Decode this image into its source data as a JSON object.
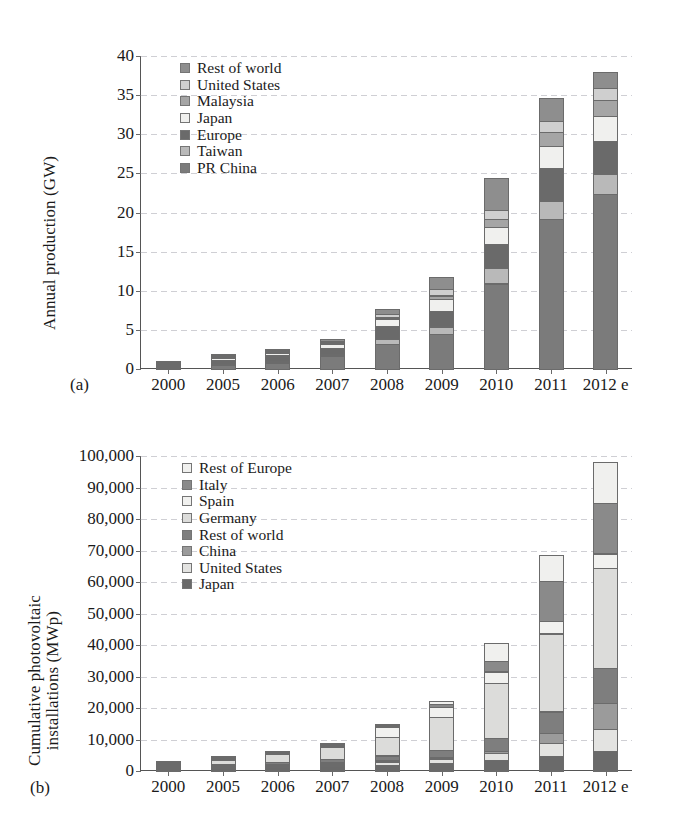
{
  "figure": {
    "panels": [
      {
        "key": "a",
        "label": "(a)",
        "ylabel": "Annual production (GW)"
      },
      {
        "key": "b",
        "label": "(b)",
        "ylabel_line1": "Cumulative photovoltaic",
        "ylabel_line2": "installations (MWp)"
      }
    ]
  },
  "chart_data": [
    {
      "type": "bar",
      "stacked": true,
      "panel": "a",
      "title": "",
      "xlabel": "",
      "ylabel": "Annual production (GW)",
      "ylim": [
        0,
        40
      ],
      "yticks": [
        0,
        5,
        10,
        15,
        20,
        25,
        30,
        35,
        40
      ],
      "ytick_labels": [
        "0",
        "5",
        "10",
        "15",
        "20",
        "25",
        "30",
        "35",
        "40"
      ],
      "grid": true,
      "legend_position": "upper-left-inside",
      "categories": [
        "2000",
        "2005",
        "2006",
        "2007",
        "2008",
        "2009",
        "2010",
        "2011",
        "2012 e"
      ],
      "series": [
        {
          "name": "PR China",
          "color": "#7b7b7b",
          "values": [
            0.05,
            0.55,
            0.9,
            1.7,
            3.3,
            4.5,
            11.0,
            19.2,
            22.4
          ]
        },
        {
          "name": "Taiwan",
          "color": "#b9b9b9",
          "values": [
            0.01,
            0.1,
            0.15,
            0.3,
            0.65,
            1.1,
            2.1,
            2.5,
            2.7
          ]
        },
        {
          "name": "Europe",
          "color": "#6a6a6a",
          "values": [
            0.1,
            0.55,
            0.8,
            0.95,
            1.75,
            2.1,
            3.1,
            4.2,
            4.3
          ]
        },
        {
          "name": "Japan",
          "color": "#f0f0ee",
          "values": [
            0.1,
            0.35,
            0.45,
            0.6,
            1.1,
            1.6,
            2.3,
            2.9,
            3.3
          ]
        },
        {
          "name": "Malaysia",
          "color": "#a5a5a5",
          "values": [
            0.0,
            0.02,
            0.05,
            0.08,
            0.2,
            0.5,
            1.1,
            1.9,
            2.1
          ]
        },
        {
          "name": "United States",
          "color": "#cfcfcf",
          "values": [
            0.04,
            0.15,
            0.2,
            0.3,
            0.5,
            0.9,
            1.2,
            1.5,
            1.6
          ]
        },
        {
          "name": "Rest of world",
          "color": "#8e8e8e",
          "values": [
            0.05,
            0.18,
            0.25,
            0.4,
            0.7,
            1.7,
            4.2,
            3.0,
            2.2
          ]
        }
      ]
    },
    {
      "type": "bar",
      "stacked": true,
      "panel": "b",
      "title": "",
      "xlabel": "",
      "ylabel": "Cumulative photovoltaic installations (MWp)",
      "ylim": [
        0,
        100000
      ],
      "yticks": [
        0,
        10000,
        20000,
        30000,
        40000,
        50000,
        60000,
        70000,
        80000,
        90000,
        100000
      ],
      "ytick_labels": [
        "0",
        "10,000",
        "20,000",
        "30,000",
        "40,000",
        "50,000",
        "60,000",
        "70,000",
        "80,000",
        "90,000",
        "100,000"
      ],
      "grid": true,
      "legend_position": "upper-left-inside",
      "categories": [
        "2000",
        "2005",
        "2006",
        "2007",
        "2008",
        "2009",
        "2010",
        "2011",
        "2012 e"
      ],
      "series": [
        {
          "name": "Japan",
          "color": "#6a6a6a",
          "values": [
            330,
            1420,
            1710,
            1920,
            2150,
            2630,
            3620,
            4910,
            6600
          ]
        },
        {
          "name": "United States",
          "color": "#e3e3e1",
          "values": [
            140,
            480,
            620,
            830,
            1170,
            1620,
            2530,
            4380,
            7200
          ]
        },
        {
          "name": "China",
          "color": "#9b9b9b",
          "values": [
            20,
            70,
            90,
            110,
            150,
            310,
            900,
            3300,
            8300
          ]
        },
        {
          "name": "Rest of world",
          "color": "#7e7e7e",
          "values": [
            230,
            640,
            840,
            1200,
            1800,
            2700,
            4300,
            7100,
            11500
          ]
        },
        {
          "name": "Germany",
          "color": "#dcdcda",
          "values": [
            110,
            1910,
            2900,
            4200,
            6200,
            10600,
            17600,
            25000,
            32000
          ]
        },
        {
          "name": "Spain",
          "color": "#f1f1ef",
          "values": [
            10,
            60,
            150,
            700,
            3400,
            3500,
            3900,
            4300,
            4700
          ]
        },
        {
          "name": "Italy",
          "color": "#8a8a8a",
          "values": [
            10,
            40,
            60,
            130,
            460,
            1180,
            3500,
            12800,
            16300
          ]
        },
        {
          "name": "Rest of Europe",
          "color": "#f0f0ee",
          "values": [
            20,
            80,
            130,
            210,
            470,
            1060,
            6100,
            8500,
            13400
          ]
        }
      ]
    }
  ]
}
